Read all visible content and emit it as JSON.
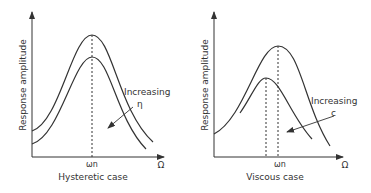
{
  "left_panel": {
    "ylabel": "Response amplitude",
    "xlabel_symbol": "Ω",
    "tick_label": "ωn",
    "annotation_line1": "Increasing",
    "annotation_line2": "η",
    "caption": "Hysteretic case"
  },
  "right_panel": {
    "ylabel": "Response amplitude",
    "xlabel_symbol": "Ω",
    "tick_label": "ωn",
    "annotation_line1": "Increasing",
    "annotation_line2": "c",
    "caption": "Viscous case"
  },
  "colors": {
    "line": "#333333",
    "background": "#ffffff"
  }
}
